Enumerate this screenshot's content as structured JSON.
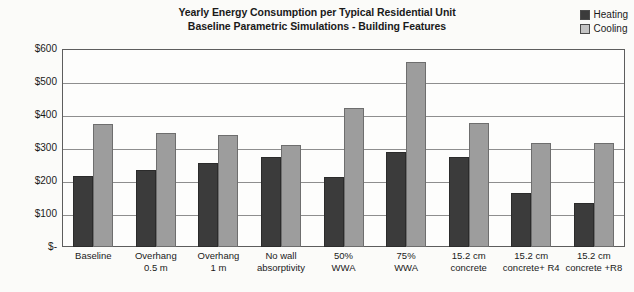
{
  "chart_data": {
    "type": "bar",
    "title": "Yearly Energy Consumption per Typical Residential Unit",
    "subtitle": "Baseline Parametric Simulations - Building Features",
    "xlabel": "",
    "ylabel": "Cost (Dollar $) @ US$0.6/KWh",
    "ylim": [
      0,
      600
    ],
    "grid": true,
    "legend_position": "top-right",
    "ytick_labels": [
      "$600",
      "$500",
      "$400",
      "$300",
      "$200",
      "$100",
      "$-"
    ],
    "ytick_values": [
      600,
      500,
      400,
      300,
      200,
      100,
      0
    ],
    "categories": [
      "Baseline",
      "Overhang\n0.5 m",
      "Overhang\n1 m",
      "No wall\nabsorptivity",
      "50%\nWWA",
      "75%\nWWA",
      "15.2 cm\nconcrete",
      "15.2 cm\nconcrete+ R4",
      "15.2 cm\nconcrete +R8"
    ],
    "series": [
      {
        "name": "Heating",
        "color": "#3b3b3b",
        "values": [
          215,
          233,
          254,
          273,
          213,
          288,
          273,
          163,
          133
        ]
      },
      {
        "name": "Cooling",
        "color": "#9d9d9d",
        "values": [
          373,
          345,
          340,
          310,
          420,
          560,
          375,
          315,
          315
        ]
      }
    ]
  },
  "legend": {
    "items": [
      {
        "label": "Heating",
        "swatch": "heating-swatch"
      },
      {
        "label": "Cooling",
        "swatch": "cooling-swatch"
      }
    ]
  }
}
